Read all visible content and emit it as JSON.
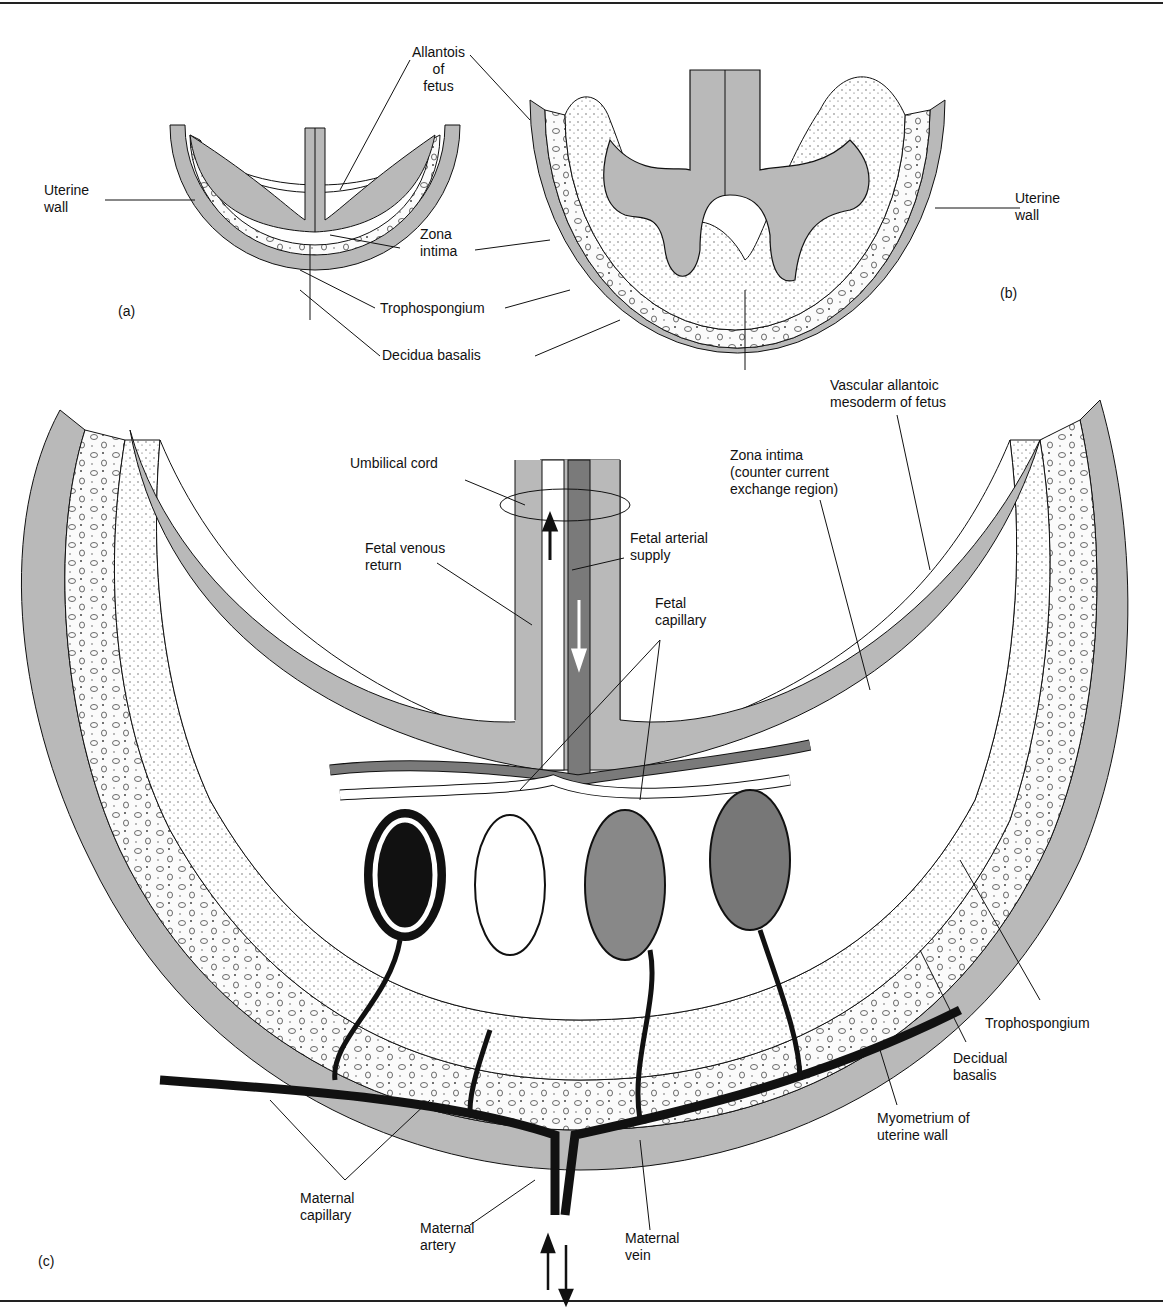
{
  "figure": {
    "panels": [
      "(a)",
      "(b)",
      "(c)"
    ],
    "colors": {
      "tissue_gray": "#b9b9b9",
      "artery_dark": "#7a7a7a",
      "maternal_black": "#111111",
      "background": "#ffffff"
    }
  },
  "panel_a": {
    "label": "(a)",
    "labels": {
      "uterine_wall": "Uterine\nwall",
      "allantois": "Allantois\nof\nfetus",
      "zona_intima": "Zona\nintima",
      "trophospongium": "Trophospongium",
      "decidua_basalis": "Decidua basalis"
    }
  },
  "panel_b": {
    "label": "(b)",
    "labels": {
      "uterine_wall": "Uterine\nwall"
    }
  },
  "panel_c": {
    "label": "(c)",
    "labels": {
      "vascular_mesoderm": "Vascular allantoic\nmesoderm of fetus",
      "zona_intima": "Zona intima\n(counter current\nexchange region)",
      "umbilical_cord": "Umbilical cord",
      "fetal_venous_return": "Fetal venous\nreturn",
      "fetal_arterial_supply": "Fetal arterial\nsupply",
      "fetal_capillary": "Fetal\ncapillary",
      "trophospongium": "Trophospongium",
      "decidual_basalis": "Decidual\nbasalis",
      "myometrium": "Myometrium of\nuterine wall",
      "maternal_capillary": "Maternal\ncapillary",
      "maternal_artery": "Maternal\nartery",
      "maternal_vein": "Maternal\nvein"
    }
  }
}
